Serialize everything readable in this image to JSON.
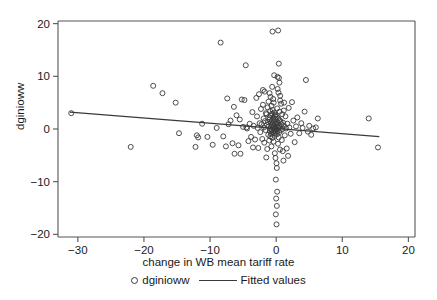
{
  "chart_data": {
    "type": "scatter",
    "title": "",
    "xlabel": "change in WB mean tariff rate",
    "ylabel": "dginioww",
    "xlim": [
      -33,
      21
    ],
    "ylim": [
      -20.5,
      20.5
    ],
    "xticks": [
      -30,
      -20,
      -10,
      0,
      10,
      20
    ],
    "xticklabels": [
      "−30",
      "−20",
      "−10",
      "0",
      "10",
      "20"
    ],
    "yticks": [
      -20,
      -10,
      0,
      10,
      20
    ],
    "yticklabels": [
      "−20",
      "−10",
      "0",
      "10",
      "20"
    ],
    "grid": false,
    "legend_position": "below-axis",
    "marker_style": "open-circle",
    "marker_color": "#3a3a3a",
    "line_color": "#3a3a3a",
    "frame_color": "#555555",
    "series": [
      {
        "name": "dginioww",
        "type": "scatter",
        "points": [
          [
            -31.0,
            3.0
          ],
          [
            -22.0,
            -3.4
          ],
          [
            -18.6,
            8.2
          ],
          [
            -17.2,
            6.8
          ],
          [
            -15.2,
            5.0
          ],
          [
            -14.7,
            -0.8
          ],
          [
            -12.2,
            -3.4
          ],
          [
            -12.0,
            -1.2
          ],
          [
            -11.8,
            -1.6
          ],
          [
            -11.2,
            1.0
          ],
          [
            -10.4,
            -1.5
          ],
          [
            -9.6,
            -3.0
          ],
          [
            -8.4,
            16.4
          ],
          [
            -7.6,
            -3.3
          ],
          [
            -7.4,
            5.8
          ],
          [
            -7.2,
            0.9
          ],
          [
            -6.9,
            1.6
          ],
          [
            -6.6,
            -2.7
          ],
          [
            -6.4,
            4.2
          ],
          [
            -6.3,
            -4.7
          ],
          [
            -6.0,
            2.6
          ],
          [
            -5.7,
            -3.1
          ],
          [
            -5.4,
            -4.7
          ],
          [
            -5.2,
            5.6
          ],
          [
            -5.0,
            0.4
          ],
          [
            -4.8,
            5.5
          ],
          [
            -4.6,
            12.1
          ],
          [
            -4.4,
            0.1
          ],
          [
            -4.2,
            -2.3
          ],
          [
            -4.0,
            1.0
          ],
          [
            -3.8,
            -1.5
          ],
          [
            -3.6,
            3.2
          ],
          [
            -3.4,
            0.6
          ],
          [
            -3.2,
            -2.0
          ],
          [
            -3.0,
            5.9
          ],
          [
            -2.9,
            2.4
          ],
          [
            -2.8,
            0.2
          ],
          [
            -2.7,
            -3.6
          ],
          [
            -2.6,
            6.6
          ],
          [
            -2.5,
            1.1
          ],
          [
            -2.4,
            -0.6
          ],
          [
            -2.3,
            3.8
          ],
          [
            -2.2,
            0.9
          ],
          [
            -2.1,
            -1.9
          ],
          [
            -2.0,
            4.6
          ],
          [
            -1.9,
            2.0
          ],
          [
            -1.85,
            0.3
          ],
          [
            -1.8,
            -2.6
          ],
          [
            -1.75,
            7.1
          ],
          [
            -1.7,
            1.5
          ],
          [
            -1.6,
            -0.2
          ],
          [
            -1.55,
            3.0
          ],
          [
            -1.5,
            -5.4
          ],
          [
            -1.45,
            2.8
          ],
          [
            -1.4,
            0.8
          ],
          [
            -1.35,
            -3.8
          ],
          [
            -1.3,
            4.1
          ],
          [
            -1.25,
            1.3
          ],
          [
            -1.2,
            -1.1
          ],
          [
            -1.15,
            5.2
          ],
          [
            -1.1,
            0.5
          ],
          [
            -1.05,
            -2.2
          ],
          [
            -1.0,
            2.2
          ],
          [
            -0.98,
            1.8
          ],
          [
            -0.95,
            -0.4
          ],
          [
            -0.92,
            3.4
          ],
          [
            -0.9,
            0.0
          ],
          [
            -0.88,
            -1.4
          ],
          [
            -0.85,
            6.1
          ],
          [
            -0.82,
            1.2
          ],
          [
            -0.8,
            -0.9
          ],
          [
            -0.78,
            2.6
          ],
          [
            -0.75,
            0.4
          ],
          [
            -0.72,
            -3.3
          ],
          [
            -0.7,
            4.4
          ],
          [
            -0.68,
            1.6
          ],
          [
            -0.65,
            -0.2
          ],
          [
            -0.62,
            2.9
          ],
          [
            -0.6,
            0.7
          ],
          [
            -0.58,
            -1.7
          ],
          [
            -0.55,
            18.5
          ],
          [
            -0.52,
            3.6
          ],
          [
            -0.5,
            1.0
          ],
          [
            -0.48,
            -0.5
          ],
          [
            -0.45,
            2.1
          ],
          [
            -0.42,
            0.2
          ],
          [
            -0.4,
            -2.4
          ],
          [
            -0.38,
            5.0
          ],
          [
            -0.35,
            1.4
          ],
          [
            -0.32,
            -0.8
          ],
          [
            -0.3,
            3.1
          ],
          [
            -0.28,
            0.6
          ],
          [
            -0.25,
            -1.3
          ],
          [
            -0.22,
            2.5
          ],
          [
            -0.2,
            0.1
          ],
          [
            -0.18,
            -0.3
          ],
          [
            -0.15,
            1.9
          ],
          [
            -0.12,
            0.9
          ],
          [
            -0.1,
            -0.7
          ],
          [
            -0.08,
            2.7
          ],
          [
            -0.05,
            0.3
          ],
          [
            0.0,
            1.1
          ],
          [
            0.05,
            -0.1
          ],
          [
            0.08,
            2.3
          ],
          [
            0.1,
            0.5
          ],
          [
            0.12,
            -1.0
          ],
          [
            0.15,
            3.9
          ],
          [
            0.18,
            1.3
          ],
          [
            0.2,
            -0.4
          ],
          [
            0.22,
            7.6
          ],
          [
            0.25,
            0.8
          ],
          [
            0.28,
            -2.8
          ],
          [
            0.3,
            18.7
          ],
          [
            0.32,
            2.0
          ],
          [
            0.35,
            0.2
          ],
          [
            0.38,
            -1.6
          ],
          [
            0.4,
            12.4
          ],
          [
            0.42,
            9.7
          ],
          [
            0.45,
            1.7
          ],
          [
            0.48,
            -0.6
          ],
          [
            0.5,
            8.8
          ],
          [
            0.52,
            3.3
          ],
          [
            0.55,
            0.4
          ],
          [
            0.58,
            -3.9
          ],
          [
            0.6,
            6.3
          ],
          [
            0.65,
            1.5
          ],
          [
            0.7,
            -0.2
          ],
          [
            0.75,
            4.8
          ],
          [
            0.8,
            0.9
          ],
          [
            0.85,
            -2.1
          ],
          [
            0.9,
            2.8
          ],
          [
            0.95,
            0.0
          ],
          [
            1.0,
            -4.2
          ],
          [
            1.05,
            1.2
          ],
          [
            1.1,
            -6.0
          ],
          [
            1.15,
            3.5
          ],
          [
            1.2,
            0.6
          ],
          [
            1.3,
            -1.2
          ],
          [
            1.4,
            2.4
          ],
          [
            1.5,
            0.1
          ],
          [
            1.6,
            -3.7
          ],
          [
            1.7,
            1.0
          ],
          [
            1.8,
            -5.1
          ],
          [
            1.9,
            4.0
          ],
          [
            2.0,
            0.3
          ],
          [
            2.2,
            -0.9
          ],
          [
            2.4,
            5.1
          ],
          [
            2.6,
            1.6
          ],
          [
            2.8,
            -2.5
          ],
          [
            3.0,
            0.5
          ],
          [
            3.2,
            2.2
          ],
          [
            3.5,
            -0.8
          ],
          [
            3.8,
            1.1
          ],
          [
            4.0,
            0.2
          ],
          [
            4.3,
            3.3
          ],
          [
            4.5,
            9.3
          ],
          [
            4.8,
            -0.5
          ],
          [
            5.0,
            0.6
          ],
          [
            5.3,
            -1.1
          ],
          [
            5.6,
            0.1
          ],
          [
            6.0,
            0.3
          ],
          [
            6.3,
            2.0
          ],
          [
            14.0,
            2.0
          ],
          [
            15.4,
            -3.5
          ],
          [
            -0.2,
            -4.6
          ],
          [
            -0.1,
            -5.5
          ],
          [
            0.05,
            -6.5
          ],
          [
            0.1,
            -7.4
          ],
          [
            -0.05,
            -9.6
          ],
          [
            0.15,
            -11.9
          ],
          [
            0.0,
            -13.2
          ],
          [
            0.1,
            -14.6
          ],
          [
            -0.05,
            -16.2
          ],
          [
            0.05,
            -18.1
          ],
          [
            -0.3,
            10.2
          ],
          [
            0.2,
            9.9
          ],
          [
            -0.6,
            8.0
          ],
          [
            0.35,
            6.9
          ],
          [
            -0.45,
            5.7
          ],
          [
            0.6,
            5.4
          ],
          [
            -1.0,
            6.8
          ],
          [
            1.2,
            5.0
          ],
          [
            -2.0,
            7.4
          ],
          [
            -4.5,
            0.3
          ],
          [
            -3.5,
            -3.5
          ],
          [
            -5.5,
            1.8
          ],
          [
            -8.0,
            -1.4
          ],
          [
            -9.0,
            0.2
          ]
        ]
      },
      {
        "name": "Fitted values",
        "type": "line",
        "x_start": -31.2,
        "y_start": 3.2,
        "x_end": 15.6,
        "y_end": -1.45,
        "slope": -0.0995,
        "intercept": 0.096
      }
    ]
  },
  "legend": {
    "entries": [
      {
        "label": "dginioww",
        "marker": "open-circle-marker"
      },
      {
        "label": "Fitted values",
        "marker": "line-marker"
      }
    ]
  },
  "axes": {
    "x_title": "change in WB mean tariff rate",
    "y_title": "dginioww"
  }
}
